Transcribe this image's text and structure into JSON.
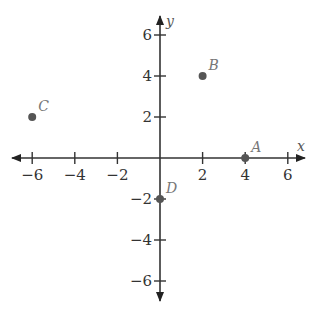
{
  "chart_data": {
    "type": "scatter",
    "title": "",
    "xlabel": "x",
    "ylabel": "y",
    "xlim": [
      -7,
      7
    ],
    "ylim": [
      -7,
      7
    ],
    "grid": false,
    "x_ticks": [
      -6,
      -4,
      -2,
      2,
      4,
      6
    ],
    "y_ticks": [
      6,
      4,
      2,
      -2,
      -4,
      -6
    ],
    "x_tick_labels": [
      "−6",
      "−4",
      "−2",
      "2",
      "4",
      "6"
    ],
    "y_tick_labels": [
      "6",
      "4",
      "2",
      "−2",
      "−4",
      "−6"
    ],
    "points": [
      {
        "label": "A",
        "x": 4,
        "y": 0
      },
      {
        "label": "B",
        "x": 2,
        "y": 4
      },
      {
        "label": "C",
        "x": -6,
        "y": 2
      },
      {
        "label": "D",
        "x": 0,
        "y": -2
      }
    ],
    "point_color": "#555555",
    "axis_color": "#222222"
  }
}
